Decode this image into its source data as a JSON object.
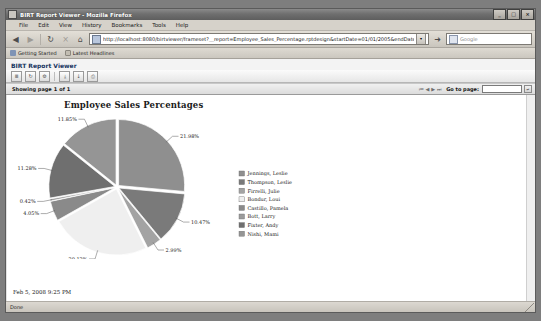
{
  "window": {
    "title": "BIRT Report Viewer - Mozilla Firefox",
    "minimize_label": "_",
    "maximize_label": "□",
    "close_label": "×"
  },
  "menubar": {
    "items": [
      {
        "label": "File"
      },
      {
        "label": "Edit"
      },
      {
        "label": "View"
      },
      {
        "label": "History"
      },
      {
        "label": "Bookmarks"
      },
      {
        "label": "Tools"
      },
      {
        "label": "Help"
      }
    ]
  },
  "navbar": {
    "back_label": "◀",
    "forward_label": "▶",
    "reload_label": "↻",
    "stop_label": "×",
    "home_label": "⌂",
    "url": "http://localhost:8080/birtviewer/frameset?__report=Employee_Sales_Percentage.rptdesign&startDate=01/01/2005&endDate=02/01/2005",
    "url_dropdown_label": "▾",
    "go_label": "➜",
    "search_placeholder": "Google",
    "search_icon_label": "G"
  },
  "bookmarks": {
    "items": [
      {
        "label": "Getting Started",
        "icon": "bookmark-icon"
      },
      {
        "label": "Latest Headlines",
        "icon": "feed-icon"
      }
    ]
  },
  "viewer": {
    "header_title": "BIRT Report Viewer",
    "toolbar": [
      {
        "name": "toc-button",
        "glyph": "≣"
      },
      {
        "name": "refresh-button",
        "glyph": "↻"
      },
      {
        "name": "parameters-button",
        "glyph": "⚙"
      },
      {
        "name": "export-report-button",
        "glyph": "⤓"
      },
      {
        "name": "export-data-button",
        "glyph": "↓"
      },
      {
        "name": "print-button",
        "glyph": "⎙"
      }
    ],
    "pagebar": {
      "showing_label": "Showing page",
      "current_page": "1",
      "of_label": "of",
      "total_pages": "1",
      "first_page_label": "⏮",
      "prev_page_label": "◀",
      "next_page_label": "▶",
      "last_page_label": "⏭",
      "goto_label": "Go to page:",
      "goto_value": "",
      "goto_button_label": "↵"
    }
  },
  "report": {
    "title": "Employee Sales Percentages",
    "timestamp": "Feb 5, 2008 9:25 PM"
  },
  "statusbar": {
    "text": "Done"
  },
  "chart_data": {
    "type": "pie",
    "title": "Employee Sales Percentages",
    "legend_position": "right",
    "categories": [
      "Jennings, Leslie",
      "Thompson, Leslie",
      "Firrelli, Julie",
      "Bondur, Loui",
      "Castillo, Pamela",
      "Bott, Larry",
      "Fixter, Andy",
      "Nishi, Mami"
    ],
    "values": [
      21.98,
      10.47,
      2.99,
      20.12,
      4.05,
      0.42,
      11.28,
      11.85
    ],
    "value_labels": [
      "21.98%",
      "10.47%",
      "2.99%",
      "20.12%",
      "4.05%",
      "0.42%",
      "11.28%",
      "11.85%"
    ],
    "colors": [
      "#8f8f8f",
      "#7a7a7a",
      "#a3a3a3",
      "#efefef",
      "#8a8a8a",
      "#9b9b9b",
      "#6f6f6f",
      "#959595"
    ],
    "xlabel": "",
    "ylabel": ""
  }
}
